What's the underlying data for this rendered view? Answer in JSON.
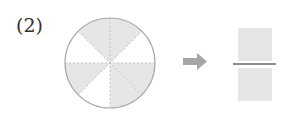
{
  "problem": {
    "number_label": "(2)"
  },
  "circle": {
    "total_parts": 8,
    "shaded_parts": 5,
    "fill_color": "#e6e6e6",
    "outline_color": "#aaaaaa"
  },
  "arrow": {
    "icon": "right-arrow-icon",
    "color": "#a6a6a6"
  },
  "fraction": {
    "numerator": "",
    "denominator": "",
    "box_color": "#e6e6e6",
    "bar_color": "#666666"
  }
}
